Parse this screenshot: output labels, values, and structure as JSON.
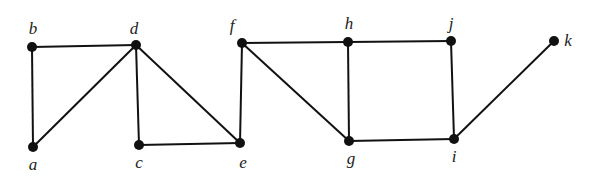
{
  "graph": {
    "vertices": [
      {
        "id": "a",
        "label": "a",
        "x": 33,
        "y": 147,
        "lx": 33,
        "ly": 170
      },
      {
        "id": "b",
        "label": "b",
        "x": 32,
        "y": 47,
        "lx": 33,
        "ly": 34
      },
      {
        "id": "c",
        "label": "c",
        "x": 139,
        "y": 145,
        "lx": 139,
        "ly": 168
      },
      {
        "id": "d",
        "label": "d",
        "x": 136,
        "y": 45,
        "lx": 134,
        "ly": 34
      },
      {
        "id": "e",
        "label": "e",
        "x": 240,
        "y": 143,
        "lx": 243,
        "ly": 168
      },
      {
        "id": "f",
        "label": "f",
        "x": 242,
        "y": 43,
        "lx": 232,
        "ly": 31
      },
      {
        "id": "g",
        "label": "g",
        "x": 349,
        "y": 141,
        "lx": 351,
        "ly": 164
      },
      {
        "id": "h",
        "label": "h",
        "x": 348,
        "y": 42,
        "lx": 349,
        "ly": 29
      },
      {
        "id": "i",
        "label": "i",
        "x": 454,
        "y": 139,
        "lx": 454,
        "ly": 162
      },
      {
        "id": "j",
        "label": "j",
        "x": 451,
        "y": 41,
        "lx": 451,
        "ly": 29
      },
      {
        "id": "k",
        "label": "k",
        "x": 554,
        "y": 41,
        "lx": 568,
        "ly": 46
      }
    ],
    "edges": [
      [
        "a",
        "b"
      ],
      [
        "a",
        "d"
      ],
      [
        "b",
        "d"
      ],
      [
        "c",
        "d"
      ],
      [
        "d",
        "e"
      ],
      [
        "c",
        "e"
      ],
      [
        "e",
        "f"
      ],
      [
        "f",
        "h"
      ],
      [
        "f",
        "g"
      ],
      [
        "g",
        "h"
      ],
      [
        "h",
        "j"
      ],
      [
        "g",
        "i"
      ],
      [
        "i",
        "j"
      ],
      [
        "i",
        "k"
      ]
    ],
    "colors": {
      "edge": "#111111",
      "vertex": "#111111",
      "label": "#222222"
    }
  }
}
